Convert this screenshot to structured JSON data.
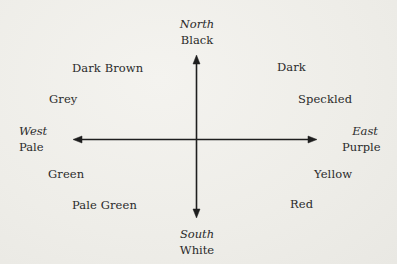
{
  "diagram": {
    "type": "compass",
    "directions": {
      "north": {
        "name": "North",
        "color": "Black"
      },
      "south": {
        "name": "South",
        "color": "White"
      },
      "west": {
        "name": "West",
        "color": "Pale"
      },
      "east": {
        "name": "East",
        "color": "Purple"
      }
    },
    "intermediate": {
      "north_west_upper": "Dark Brown",
      "north_west_lower": "Grey",
      "south_west_upper": "Green",
      "south_west_lower": "Pale Green",
      "north_east_upper": "Dark",
      "north_east_lower": "Speckled",
      "south_east_upper": "Yellow",
      "south_east_lower": "Red"
    },
    "colors": {
      "ink": "#2a2a2a",
      "paper": "#f0efeb"
    }
  }
}
